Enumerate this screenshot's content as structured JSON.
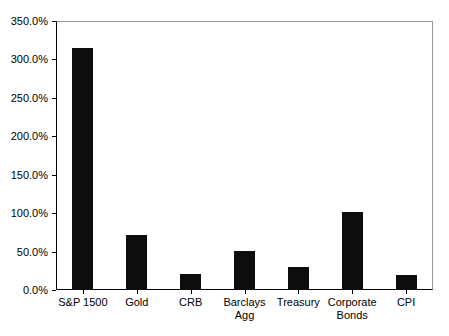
{
  "chart_data": {
    "type": "bar",
    "title": "",
    "subtitle": "",
    "xlabel": "",
    "ylabel": "",
    "categories": [
      "S&P 1500",
      "Gold",
      "CRB",
      "Barclays Agg",
      "Treasury",
      "Corporate Bonds",
      "CPI"
    ],
    "values": [
      315.0,
      72.0,
      21.0,
      51.0,
      30.0,
      102.0,
      20.0
    ],
    "ylim": [
      0,
      350
    ],
    "ytick_labels": [
      "0.0%",
      "50.0%",
      "100.0%",
      "150.0%",
      "200.0%",
      "250.0%",
      "300.0%",
      "350.0%"
    ],
    "ytick_values": [
      0,
      50,
      100,
      150,
      200,
      250,
      300,
      350
    ],
    "grid": false,
    "legend": "none",
    "bar_color": "#0d0d0d",
    "axis_color": "#000000",
    "background_color": "#ffffff"
  }
}
